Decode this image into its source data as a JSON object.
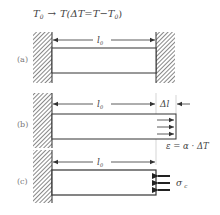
{
  "title": {
    "initial_temp": "T",
    "initial_sub": "0",
    "arrow": "→",
    "expression": "T(ΔT=T−T",
    "expression_sub": "0",
    "expression_close": ")"
  },
  "panels": [
    {
      "label": "(a)",
      "length_label": "l",
      "length_sub": "0",
      "description": "Bar fixed between two walls"
    },
    {
      "label": "(b)",
      "length_label": "l",
      "length_sub": "0",
      "delta_label": "Δl",
      "strain_formula": "ε = α · ΔT",
      "description": "Free thermal expansion"
    },
    {
      "label": "(c)",
      "length_label": "l",
      "length_sub": "0",
      "stress_label": "σ",
      "stress_sub": "c",
      "description": "Compressive stress restoring original length"
    }
  ],
  "colors": {
    "line": "#333333",
    "hatch": "#555555",
    "text": "#444444",
    "label": "#777777"
  }
}
